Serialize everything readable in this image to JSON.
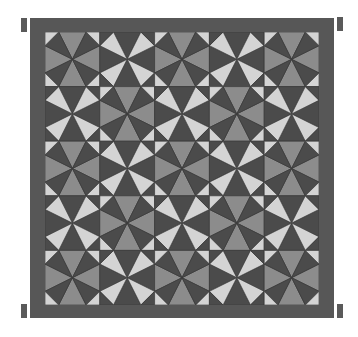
{
  "artwork": {
    "title": "Kaleidoscope quilt pattern",
    "grid": {
      "rows": 5,
      "cols": 5
    },
    "block_types": {
      "A": {
        "axial": "#8c8c8c",
        "diagonal": "#4b4b4b",
        "corner": "#d4d4d4"
      },
      "B": {
        "axial": "#4b4b4b",
        "diagonal": "#d4d4d4",
        "corner": "#4b4b4b"
      }
    },
    "layout": "checkerboard",
    "first_block": "A",
    "line_color": "#3a3a3a",
    "frame_color": "#575757",
    "tab_color": "#5a5a5a"
  }
}
